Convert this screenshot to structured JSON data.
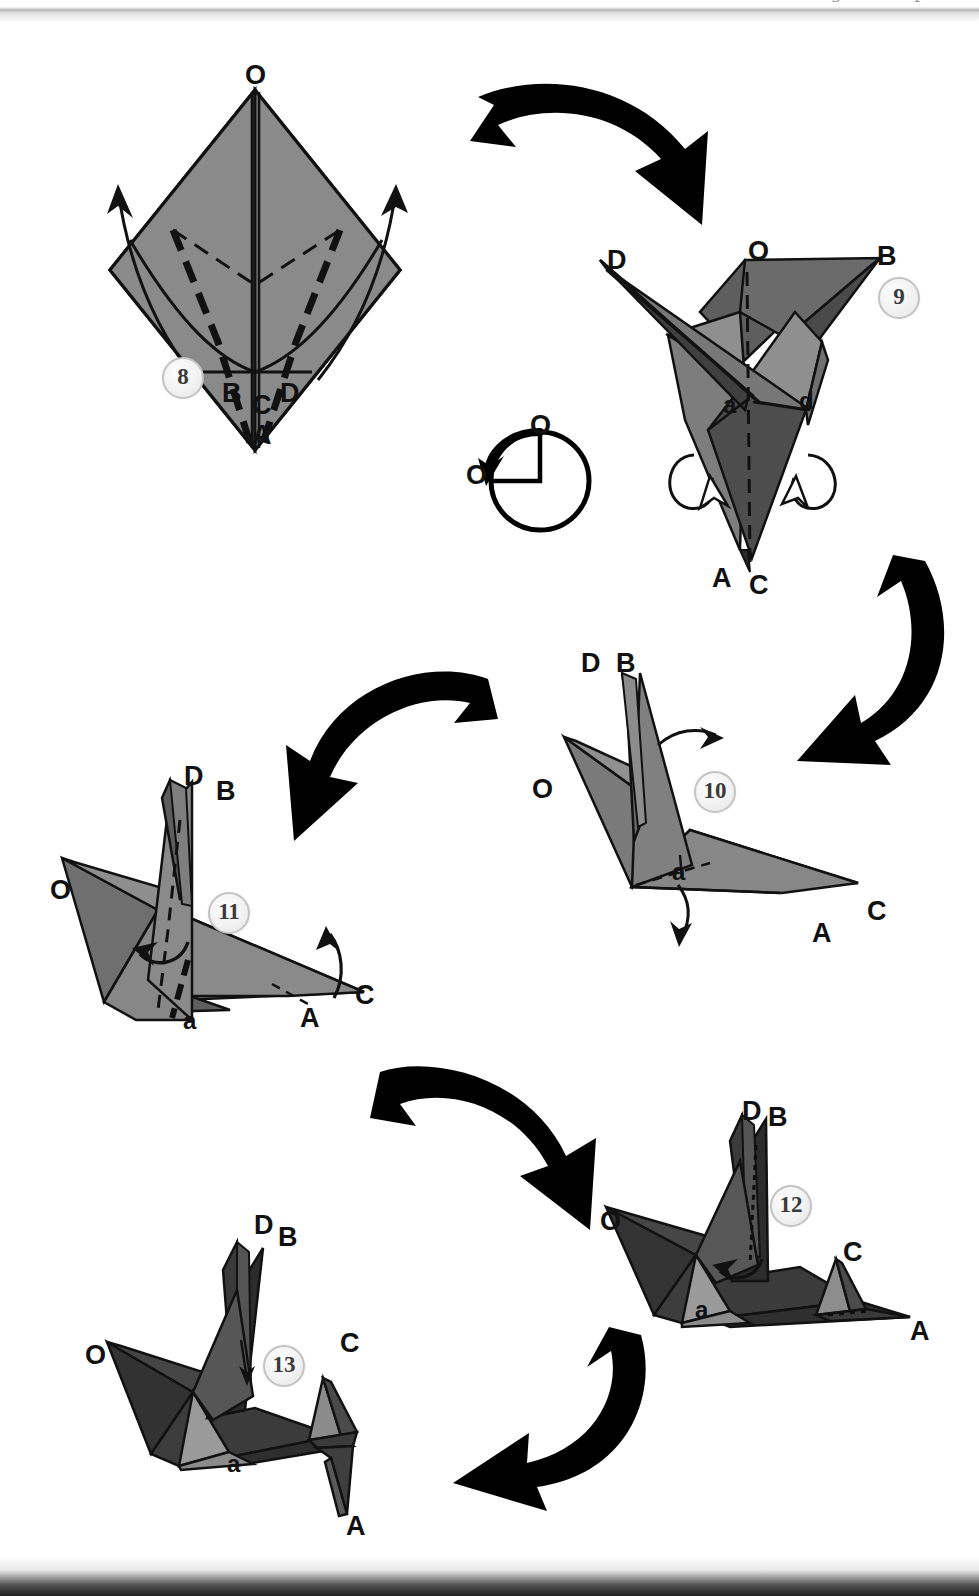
{
  "page": {
    "header_bleed_text": "3 1",
    "background": "#ffffff",
    "paper_front": "#8a8a8a",
    "paper_back": "#5e5e5e",
    "paper_dark": "#3a3a3a",
    "paper_darkest": "#232323",
    "paper_light": "#9d9d9d",
    "outline": "#111111",
    "arrow_color": "#000000",
    "badge_fill": "#f2f2f2",
    "badge_ring": "#c3c3c3"
  },
  "steps": [
    {
      "id": "step-8",
      "number": "8",
      "badge": {
        "x": 162,
        "y": 357
      },
      "labels": [
        {
          "name": "vertex-O",
          "text": "O",
          "x": 245,
          "y": 62,
          "size": "cap"
        },
        {
          "name": "vertex-B",
          "text": "B",
          "x": 222,
          "y": 380,
          "size": "cap"
        },
        {
          "name": "vertex-C",
          "text": "C",
          "x": 252,
          "y": 392,
          "size": "cap"
        },
        {
          "name": "vertex-D",
          "text": "D",
          "x": 280,
          "y": 380,
          "size": "cap"
        },
        {
          "name": "vertex-A",
          "text": "A",
          "x": 252,
          "y": 422,
          "size": "cap"
        }
      ]
    },
    {
      "id": "step-9",
      "number": "9",
      "badge": {
        "x": 878,
        "y": 277
      },
      "labels": [
        {
          "name": "vertex-D",
          "text": "D",
          "x": 607,
          "y": 247,
          "size": "cap"
        },
        {
          "name": "vertex-O",
          "text": "O",
          "x": 748,
          "y": 238,
          "size": "cap"
        },
        {
          "name": "vertex-B",
          "text": "B",
          "x": 877,
          "y": 243,
          "size": "cap"
        },
        {
          "name": "crease-a",
          "text": "a",
          "x": 723,
          "y": 393,
          "size": "low"
        },
        {
          "name": "crease-d",
          "text": "d",
          "x": 799,
          "y": 389,
          "size": "low"
        },
        {
          "name": "vertex-A",
          "text": "A",
          "x": 712,
          "y": 565,
          "size": "cap"
        },
        {
          "name": "vertex-C",
          "text": "C",
          "x": 749,
          "y": 572,
          "size": "cap"
        }
      ]
    },
    {
      "id": "step-10",
      "number": "10",
      "badge": {
        "x": 694,
        "y": 771
      },
      "labels": [
        {
          "name": "vertex-D",
          "text": "D",
          "x": 581,
          "y": 650,
          "size": "cap"
        },
        {
          "name": "vertex-B",
          "text": "B",
          "x": 616,
          "y": 650,
          "size": "cap"
        },
        {
          "name": "vertex-O",
          "text": "O",
          "x": 532,
          "y": 776,
          "size": "cap"
        },
        {
          "name": "crease-a",
          "text": "a",
          "x": 672,
          "y": 860,
          "size": "low"
        },
        {
          "name": "vertex-C",
          "text": "C",
          "x": 867,
          "y": 898,
          "size": "cap"
        },
        {
          "name": "vertex-A",
          "text": "A",
          "x": 812,
          "y": 920,
          "size": "cap"
        }
      ]
    },
    {
      "id": "step-11",
      "number": "11",
      "badge": {
        "x": 208,
        "y": 892
      },
      "labels": [
        {
          "name": "vertex-D",
          "text": "D",
          "x": 184,
          "y": 763,
          "size": "cap"
        },
        {
          "name": "vertex-B",
          "text": "B",
          "x": 216,
          "y": 778,
          "size": "cap"
        },
        {
          "name": "vertex-O",
          "text": "O",
          "x": 50,
          "y": 877,
          "size": "cap"
        },
        {
          "name": "crease-a",
          "text": "a",
          "x": 183,
          "y": 1009,
          "size": "low"
        },
        {
          "name": "vertex-C",
          "text": "C",
          "x": 355,
          "y": 982,
          "size": "cap"
        },
        {
          "name": "vertex-A",
          "text": "A",
          "x": 300,
          "y": 1005,
          "size": "cap"
        }
      ]
    },
    {
      "id": "step-12",
      "number": "12",
      "badge": {
        "x": 770,
        "y": 1185
      },
      "labels": [
        {
          "name": "vertex-D",
          "text": "D",
          "x": 742,
          "y": 1098,
          "size": "cap"
        },
        {
          "name": "vertex-B",
          "text": "B",
          "x": 768,
          "y": 1104,
          "size": "cap"
        },
        {
          "name": "vertex-O",
          "text": "O",
          "x": 600,
          "y": 1208,
          "size": "cap"
        },
        {
          "name": "crease-a",
          "text": "a",
          "x": 695,
          "y": 1298,
          "size": "low"
        },
        {
          "name": "vertex-C",
          "text": "C",
          "x": 843,
          "y": 1239,
          "size": "cap"
        },
        {
          "name": "vertex-A",
          "text": "A",
          "x": 910,
          "y": 1318,
          "size": "cap"
        }
      ]
    },
    {
      "id": "step-13",
      "number": "13",
      "badge": {
        "x": 263,
        "y": 1345
      },
      "labels": [
        {
          "name": "vertex-D",
          "text": "D",
          "x": 254,
          "y": 1212,
          "size": "cap"
        },
        {
          "name": "vertex-B",
          "text": "B",
          "x": 278,
          "y": 1224,
          "size": "cap"
        },
        {
          "name": "vertex-O",
          "text": "O",
          "x": 85,
          "y": 1342,
          "size": "cap"
        },
        {
          "name": "crease-a",
          "text": "a",
          "x": 227,
          "y": 1452,
          "size": "low"
        },
        {
          "name": "vertex-C",
          "text": "C",
          "x": 340,
          "y": 1330,
          "size": "cap"
        },
        {
          "name": "vertex-A",
          "text": "A",
          "x": 346,
          "y": 1513,
          "size": "cap"
        }
      ]
    }
  ],
  "rotation_symbol": {
    "name": "rotate-90-symbol",
    "label_top": "O",
    "label_left": "O",
    "description": "rotate model 90 degrees counter-clockwise"
  },
  "flow_arrows": [
    {
      "name": "flow-arrow-8-to-9",
      "from": "step-8",
      "to": "step-9"
    },
    {
      "name": "flow-arrow-9-to-10",
      "from": "step-9",
      "to": "step-10"
    },
    {
      "name": "flow-arrow-10-to-11",
      "from": "step-10",
      "to": "step-11"
    },
    {
      "name": "flow-arrow-11-to-12",
      "from": "step-11",
      "to": "step-12"
    },
    {
      "name": "flow-arrow-12-to-13",
      "from": "step-12",
      "to": "step-13"
    }
  ]
}
